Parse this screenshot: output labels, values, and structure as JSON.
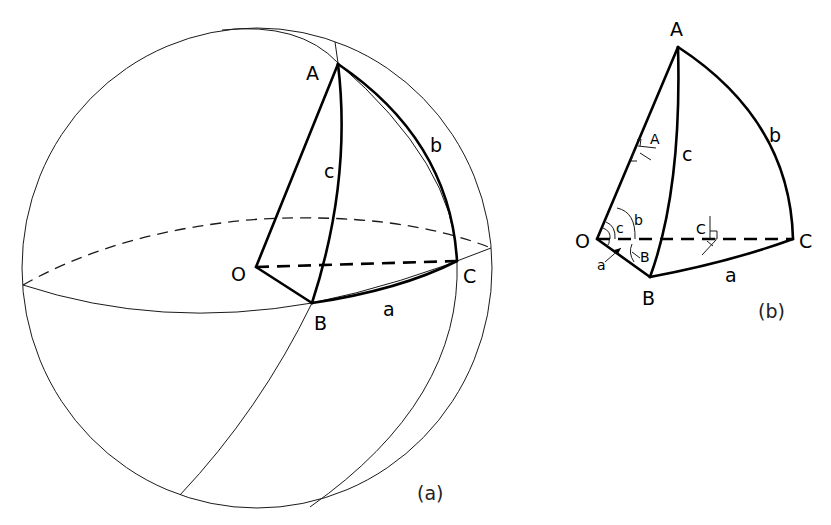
{
  "figure_a": {
    "caption": "(a)",
    "labels": {
      "A": "A",
      "B": "B",
      "C": "C",
      "O": "O",
      "a": "a",
      "b": "b",
      "c": "c"
    }
  },
  "figure_b": {
    "caption": "(b)",
    "labels": {
      "A": "A",
      "B": "B",
      "C": "C",
      "O": "O",
      "a": "a",
      "b": "b",
      "c": "c"
    },
    "angle_labels": {
      "A": "A",
      "B": "B",
      "C": "C",
      "a": "a",
      "b": "b",
      "c": "c"
    }
  },
  "colors": {
    "line": "#000000",
    "background": "#ffffff"
  }
}
